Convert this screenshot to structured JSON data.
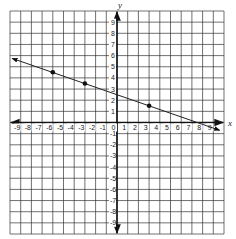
{
  "chart_data": {
    "type": "line",
    "title": "",
    "xlabel": "x",
    "ylabel": "y",
    "xlim": [
      -10,
      10
    ],
    "ylim": [
      -10,
      10
    ],
    "grid": true,
    "x_ticks": [
      -9,
      -8,
      -7,
      -6,
      -5,
      -4,
      -3,
      -2,
      -1,
      0,
      1,
      2,
      3,
      4,
      5,
      6,
      7,
      8,
      9
    ],
    "y_ticks": [
      9,
      8,
      7,
      6,
      5,
      4,
      3,
      2,
      1,
      -1,
      -2,
      -3,
      -4,
      -5,
      -6,
      -7,
      -8,
      -9
    ],
    "series": [
      {
        "name": "line",
        "slope": -0.3333,
        "intercept": 2.5,
        "endpoints": [
          {
            "x": -9.8,
            "y": 5.75
          },
          {
            "x": 9.6,
            "y": -0.7
          }
        ],
        "arrows": "both"
      }
    ],
    "points": [
      {
        "x": -6,
        "y": 4.5
      },
      {
        "x": -3,
        "y": 3.5
      },
      {
        "x": 3,
        "y": 1.5
      }
    ]
  },
  "labels": {
    "x_axis": "x",
    "y_axis": "y"
  }
}
